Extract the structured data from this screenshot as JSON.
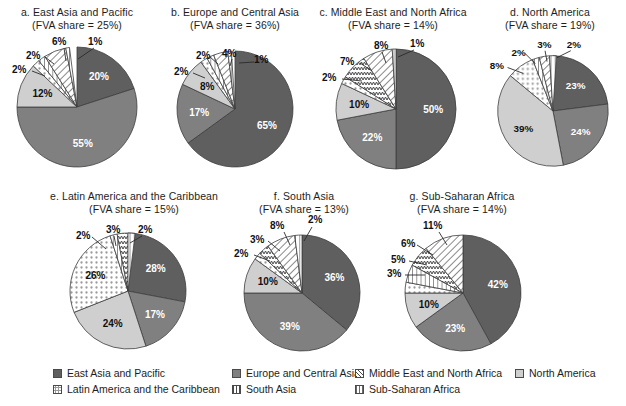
{
  "chart_data": [
    {
      "type": "pie",
      "id": "a",
      "title": "a. East Asia and Pacific",
      "subtitle": "(FVA share = 25%)",
      "categories": [
        "East Asia and Pacific",
        "Europe and Central Asia",
        "North America",
        "Latin America and the Caribbean",
        "Sub-Saharan Africa",
        "Middle East and North Africa",
        "South Asia"
      ],
      "values": [
        20,
        55,
        12,
        2,
        2,
        6,
        1
      ],
      "labels": [
        "20%",
        "55%",
        "12%",
        "2%",
        "2%",
        "6%",
        "1%"
      ]
    },
    {
      "type": "pie",
      "id": "b",
      "title": "b. Europe and Central Asia",
      "subtitle": "(FVA share = 36%)",
      "categories": [
        "East Asia and Pacific",
        "Europe and Central Asia",
        "North America",
        "Latin America and the Caribbean",
        "Sub-Saharan Africa",
        "Middle East and North Africa",
        "South Asia"
      ],
      "values": [
        65,
        17,
        8,
        2,
        2,
        4,
        1
      ],
      "labels": [
        "65%",
        "17%",
        "8%",
        "2%",
        "2%",
        "4%",
        "1%"
      ]
    },
    {
      "type": "pie",
      "id": "c",
      "title": "c. Middle East and North Africa",
      "subtitle": "(FVA share = 14%)",
      "categories": [
        "East Asia and Pacific",
        "Europe and Central Asia",
        "North America",
        "Latin America and the Caribbean",
        "Sub-Saharan Africa",
        "Middle East and North Africa",
        "South Asia"
      ],
      "values": [
        50,
        22,
        10,
        2,
        7,
        8,
        1
      ],
      "labels": [
        "50%",
        "22%",
        "10%",
        "2%",
        "7%",
        "8%",
        "1%"
      ]
    },
    {
      "type": "pie",
      "id": "d",
      "title": "d. North America",
      "subtitle": "(FVA share = 19%)",
      "categories": [
        "East Asia and Pacific",
        "Europe and Central Asia",
        "North America",
        "Latin America and the Caribbean",
        "Sub-Saharan Africa",
        "Middle East and North Africa",
        "South Asia"
      ],
      "values": [
        23,
        24,
        39,
        8,
        2,
        3,
        2
      ],
      "labels": [
        "23%",
        "24%",
        "39%",
        "8%",
        "2%",
        "3%",
        "2%"
      ]
    },
    {
      "type": "pie",
      "id": "e",
      "title": "e. Latin America and the Caribbean",
      "subtitle": "(FVA share = 15%)",
      "categories": [
        "East Asia and Pacific",
        "Europe and Central Asia",
        "North America",
        "Latin America and the Caribbean",
        "Sub-Saharan Africa",
        "Middle East and North Africa",
        "South Asia"
      ],
      "values": [
        28,
        17,
        24,
        26,
        2,
        3,
        2
      ],
      "labels": [
        "28%",
        "17%",
        "24%",
        "26%",
        "2%",
        "3%",
        "2%"
      ]
    },
    {
      "type": "pie",
      "id": "f",
      "title": "f. South Asia",
      "subtitle": "(FVA share = 13%)",
      "categories": [
        "East Asia and Pacific",
        "Europe and Central Asia",
        "North America",
        "Latin America and the Caribbean",
        "Sub-Saharan Africa",
        "Middle East and North Africa",
        "South Asia"
      ],
      "values": [
        36,
        39,
        10,
        2,
        3,
        8,
        2
      ],
      "labels": [
        "36%",
        "39%",
        "10%",
        "2%",
        "3%",
        "8%",
        "2%"
      ]
    },
    {
      "type": "pie",
      "id": "g",
      "title": "g. Sub-Saharan Africa",
      "subtitle": "(FVA share = 14%)",
      "categories": [
        "East Asia and Pacific",
        "Europe and Central Asia",
        "North America",
        "Latin America and the Caribbean",
        "Sub-Saharan Africa",
        "Middle East and North Africa",
        "South Asia"
      ],
      "values": [
        42,
        23,
        10,
        3,
        5,
        6,
        11
      ],
      "labels": [
        "42%",
        "23%",
        "10%",
        "3%",
        "5%",
        "6%",
        "11%"
      ]
    }
  ],
  "charts": {
    "a": {
      "title": "a. East Asia and Pacific",
      "subtitle": "(FVA share = 25%)",
      "labels": {
        "s1": "20%",
        "s2": "55%",
        "s3": "12%",
        "s4": "2%",
        "s5": "2%",
        "s6": "6%",
        "s7": "1%"
      }
    },
    "b": {
      "title": "b. Europe and Central Asia",
      "subtitle": "(FVA share = 36%)",
      "labels": {
        "s1": "65%",
        "s2": "17%",
        "s3": "8%",
        "s4": "2%",
        "s5": "2%",
        "s6": "4%",
        "s7": "1%"
      }
    },
    "c": {
      "title": "c. Middle East and North Africa",
      "subtitle": "(FVA share = 14%)",
      "labels": {
        "s1": "50%",
        "s2": "22%",
        "s3": "10%",
        "s4": "2%",
        "s5": "7%",
        "s6": "8%",
        "s7": "1%"
      }
    },
    "d": {
      "title": "d. North America",
      "subtitle": "(FVA share = 19%)",
      "labels": {
        "s1": "23%",
        "s2": "24%",
        "s3": "39%",
        "s4": "8%",
        "s5": "2%",
        "s6": "3%",
        "s7": "2%"
      }
    },
    "e": {
      "title": "e. Latin America and the Caribbean",
      "subtitle": "(FVA share = 15%)",
      "labels": {
        "s1": "28%",
        "s2": "17%",
        "s3": "24%",
        "s4": "26%",
        "s5": "2%",
        "s6": "3%",
        "s7": "2%"
      }
    },
    "f": {
      "title": "f. South Asia",
      "subtitle": "(FVA share = 13%)",
      "labels": {
        "s1": "36%",
        "s2": "39%",
        "s3": "10%",
        "s4": "2%",
        "s5": "3%",
        "s6": "8%",
        "s7": "2%"
      }
    },
    "g": {
      "title": "g. Sub-Saharan Africa",
      "subtitle": "(FVA share = 14%)",
      "labels": {
        "s1": "42%",
        "s2": "23%",
        "s3": "10%",
        "s4": "3%",
        "s5": "5%",
        "s6": "6%",
        "s7": "11%"
      }
    }
  },
  "legend": {
    "items": [
      {
        "key": "eap",
        "label": "East Asia and Pacific",
        "pattern": "solid-dark",
        "color": "#5f5f5f"
      },
      {
        "key": "eca",
        "label": "Europe and Central Asia",
        "pattern": "solid-mid",
        "color": "#7d7d7d"
      },
      {
        "key": "mena",
        "label": "Middle East and North Africa",
        "pattern": "diagonal-hatch",
        "color": "#ffffff"
      },
      {
        "key": "na",
        "label": "North America",
        "pattern": "solid-light",
        "color": "#c9c9c9"
      },
      {
        "key": "lac",
        "label": "Latin America and the Caribbean",
        "pattern": "dots",
        "color": "#ffffff"
      },
      {
        "key": "sa",
        "label": "South Asia",
        "pattern": "vertical-lines",
        "color": "#ffffff"
      },
      {
        "key": "ssa",
        "label": "Sub-Saharan Africa",
        "pattern": "zigzag",
        "color": "#ffffff"
      }
    ]
  }
}
